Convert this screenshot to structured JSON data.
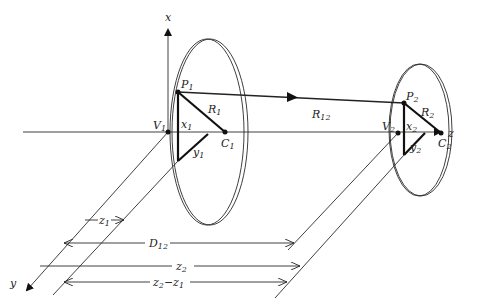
{
  "figure": {
    "axes": {
      "x": "x",
      "y": "y",
      "z": "z"
    },
    "loop1": {
      "vertex": {
        "main": "V",
        "sub": "1"
      },
      "point": {
        "main": "P",
        "sub": "1"
      },
      "center": {
        "main": "C",
        "sub": "1"
      },
      "radius": {
        "main": "R",
        "sub": "1"
      },
      "x_coord": {
        "main": "x",
        "sub": "1"
      },
      "y_coord": {
        "main": "y",
        "sub": "1"
      }
    },
    "loop2": {
      "vertex": {
        "main": "V",
        "sub": "2"
      },
      "point": {
        "main": "P",
        "sub": "2"
      },
      "center": {
        "main": "C",
        "sub": "2"
      },
      "radius": {
        "main": "R",
        "sub": "2"
      },
      "x_coord": {
        "main": "x",
        "sub": "2"
      },
      "y_coord": {
        "main": "y",
        "sub": "2"
      }
    },
    "separation_vector": {
      "main": "R",
      "sub": "12"
    },
    "dimensions": [
      {
        "main": "z",
        "sub": "1",
        "extra": ""
      },
      {
        "main": "D",
        "sub": "12",
        "extra": ""
      },
      {
        "main": "z",
        "sub": "2",
        "extra": ""
      },
      {
        "main": "z",
        "sub": "2",
        "extra": "−z",
        "extra_sub": "1"
      }
    ]
  }
}
